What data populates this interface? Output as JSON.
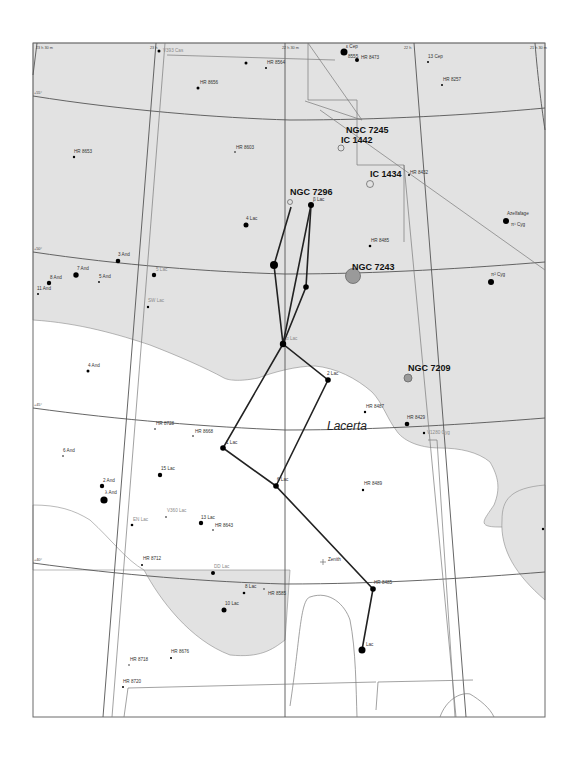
{
  "chart": {
    "constellation_name": "Lacerta",
    "grid_labels": {
      "ra": [
        "23 h 30 m",
        "23 h",
        "22 h 30 m",
        "22 h",
        "21 h 30 m"
      ],
      "dec": [
        "+55°",
        "+50°",
        "+45°",
        "+40°"
      ]
    },
    "deep_sky_objects": [
      {
        "id": "ngc7245",
        "label": "NGC 7245"
      },
      {
        "id": "ic1442",
        "label": "IC 1442"
      },
      {
        "id": "ic1434",
        "label": "IC 1434"
      },
      {
        "id": "ngc7296",
        "label": "NGC 7296"
      },
      {
        "id": "ngc7243",
        "label": "NGC 7243"
      },
      {
        "id": "ngc7209",
        "label": "NGC 7209"
      }
    ],
    "stars": [
      {
        "label": "ε Cep"
      },
      {
        "label": "8555"
      },
      {
        "label": "HR 8473"
      },
      {
        "label": "13 Cep"
      },
      {
        "label": "HR 8257"
      },
      {
        "label": "V393 Cas"
      },
      {
        "label": "HR 8564"
      },
      {
        "label": "HR 8656"
      },
      {
        "label": "HR 8603"
      },
      {
        "label": "HR 8653"
      },
      {
        "label": "HR 8432"
      },
      {
        "label": "β Lac"
      },
      {
        "label": "4 Lac"
      },
      {
        "label": "HR 8485"
      },
      {
        "label": "Azelfafage"
      },
      {
        "label": "π¹ Cyg"
      },
      {
        "label": "π² Cyg"
      },
      {
        "label": "3 And"
      },
      {
        "label": "7 And"
      },
      {
        "label": "8 And"
      },
      {
        "label": "5 And"
      },
      {
        "label": "11 And"
      },
      {
        "label": "5 Lac"
      },
      {
        "label": "SW Lac"
      },
      {
        "label": "α Lac"
      },
      {
        "label": "2 Lac"
      },
      {
        "label": "4 And"
      },
      {
        "label": "HR 8487"
      },
      {
        "label": "HR 8429"
      },
      {
        "label": "V1280 Cyg"
      },
      {
        "label": "HR 8728"
      },
      {
        "label": "HR 8668"
      },
      {
        "label": "1 Lac"
      },
      {
        "label": "6 Lac"
      },
      {
        "label": "HR 8489"
      },
      {
        "label": "6 And"
      },
      {
        "label": "2 And"
      },
      {
        "label": "λ And"
      },
      {
        "label": "15 Lac"
      },
      {
        "label": "V360 Lac"
      },
      {
        "label": "EN Lac"
      },
      {
        "label": "13 Lac"
      },
      {
        "label": "HR 8643"
      },
      {
        "label": "HR 8712"
      },
      {
        "label": "DD Lac"
      },
      {
        "label": "8 Lac"
      },
      {
        "label": "HR 8585"
      },
      {
        "label": "10 Lac"
      },
      {
        "label": "HR 8485"
      },
      {
        "label": "Lac"
      },
      {
        "label": "HR 8718"
      },
      {
        "label": "HR 8676"
      },
      {
        "label": "HR 8720"
      },
      {
        "label": "Zenith"
      }
    ]
  }
}
